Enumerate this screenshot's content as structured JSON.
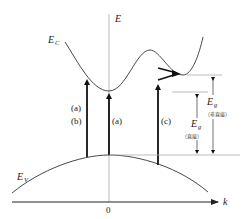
{
  "diagram": {
    "axes": {
      "y_label": "E",
      "x_label": "k",
      "origin_label": "0"
    },
    "bands": {
      "conduction": {
        "label": "E",
        "subscript": "C"
      },
      "valence": {
        "label": "E",
        "subscript": "V"
      }
    },
    "transitions": [
      {
        "id": "ab",
        "label_top": "(a)",
        "label_bottom": "(b)"
      },
      {
        "id": "a",
        "label": "(a)"
      },
      {
        "id": "c",
        "label": "(c)"
      }
    ],
    "gaps": {
      "direct": {
        "label": "E",
        "subscript": "g",
        "note": "（直接）"
      },
      "indirect": {
        "label": "E",
        "subscript": "g",
        "note": "（非直接）"
      }
    },
    "colors": {
      "curve": "#333333",
      "arrow": "#111111",
      "axis_e": "#bbbbbb",
      "axis_k": "#222222",
      "guide": "#aaaaaa"
    }
  }
}
